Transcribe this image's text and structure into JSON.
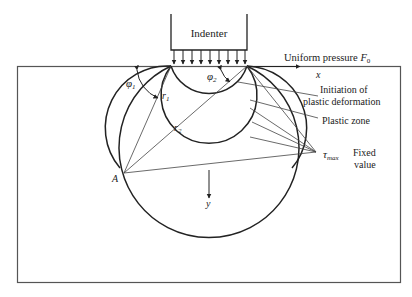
{
  "diagram": {
    "type": "indentation stress field",
    "labels": {
      "indenter": "Indenter",
      "uniform_pressure": "Uniform pressure ",
      "pressure_symbol": "F",
      "pressure_subscript": "0",
      "x_axis": "x",
      "y_axis": "y",
      "phi1": "φ",
      "phi1_sub": "1",
      "phi2": "φ",
      "phi2_sub": "2",
      "r1": "r",
      "r1_sub": "1",
      "r2": "r",
      "r2_sub": "2",
      "point_a": "A",
      "initiation_line1": "Initiation of",
      "initiation_line2": "plastic deformation",
      "plastic_zone": "Plastic zone",
      "tau": "τ",
      "tau_sub": "max",
      "fixed_line1": "Fixed",
      "fixed_line2": "value"
    },
    "colors": {
      "line": "#222222",
      "thin_line": "#444444",
      "frame": "#555555",
      "background": "#ffffff"
    }
  }
}
